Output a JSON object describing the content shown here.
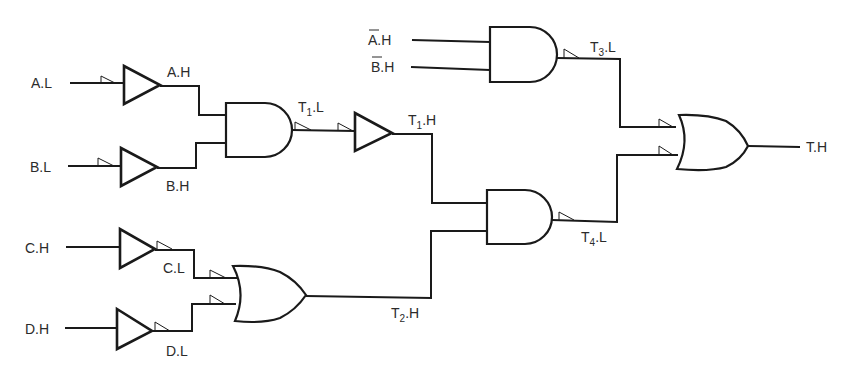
{
  "diagram": {
    "type": "logic-circuit (mixed-logic notation)",
    "inputs": [
      {
        "id": "A.L",
        "label": "A.L"
      },
      {
        "id": "B.L",
        "label": "B.L"
      },
      {
        "id": "C.H",
        "label": "C.H"
      },
      {
        "id": "D.H",
        "label": "D.H"
      },
      {
        "id": "Abar.H",
        "label": "A.H",
        "overbar": "A"
      },
      {
        "id": "Bbar.H",
        "label": "B.H",
        "overbar": "B"
      }
    ],
    "signals": {
      "a_h": "A.H",
      "b_h": "B.H",
      "c_l": "C.L",
      "d_l": "D.L",
      "t1_l": {
        "main": "T",
        "sub": "1",
        "suffix": ".L"
      },
      "t1_h": {
        "main": "T",
        "sub": "1",
        "suffix": ".H"
      },
      "t2_h": {
        "main": "T",
        "sub": "2",
        "suffix": ".H"
      },
      "t3_l": {
        "main": "T",
        "sub": "3",
        "suffix": ".L"
      },
      "t4_l": {
        "main": "T",
        "sub": "4",
        "suffix": ".L"
      },
      "output": "T.H"
    },
    "labels": {
      "a_l": "A.L",
      "b_l": "B.L",
      "c_h": "C.H",
      "d_h": "D.H",
      "abar_rest": ".H",
      "abar_letter": "A",
      "bbar_rest": ".H",
      "bbar_letter": "B"
    },
    "gates": [
      {
        "id": "buf-A",
        "type": "buffer",
        "in": "A.L",
        "out": "A.H"
      },
      {
        "id": "buf-B",
        "type": "buffer",
        "in": "B.L",
        "out": "B.H"
      },
      {
        "id": "and-1",
        "type": "AND",
        "in": [
          "A.H",
          "B.H"
        ],
        "out": "T1.L"
      },
      {
        "id": "buf-T1",
        "type": "buffer",
        "in": "T1.L",
        "out": "T1.H"
      },
      {
        "id": "buf-C",
        "type": "buffer",
        "in": "C.H",
        "out": "C.L"
      },
      {
        "id": "buf-D",
        "type": "buffer",
        "in": "D.H",
        "out": "D.L"
      },
      {
        "id": "or-1",
        "type": "OR",
        "in": [
          "C.L",
          "D.L"
        ],
        "out": "T2.H"
      },
      {
        "id": "and-3",
        "type": "AND",
        "in": [
          "Abar.H",
          "Bbar.H"
        ],
        "out": "T3.L"
      },
      {
        "id": "and-4",
        "type": "AND",
        "in": [
          "T1.H",
          "T2.H"
        ],
        "out": "T4.L"
      },
      {
        "id": "or-out",
        "type": "OR",
        "in": [
          "T3.L",
          "T4.L"
        ],
        "out": "T.H"
      }
    ]
  }
}
